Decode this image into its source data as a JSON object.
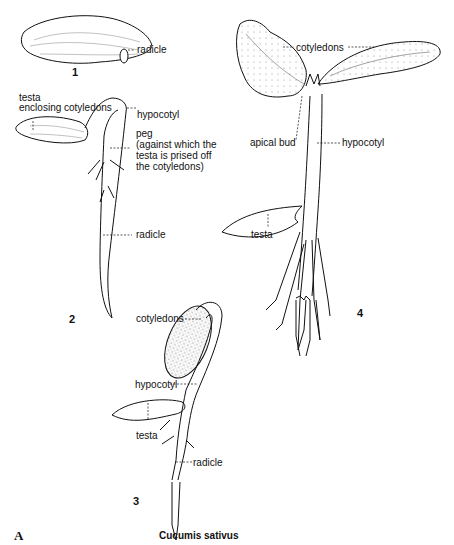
{
  "figure": {
    "letter": "A",
    "species": "Cucumis sativus"
  },
  "stages": [
    {
      "number": "1",
      "labels": {
        "radicle": "radicle"
      }
    },
    {
      "number": "2",
      "labels": {
        "testa": "testa",
        "testa_sub": "enclosing cotyledons",
        "hypocotyl": "hypocotyl",
        "peg": "peg",
        "peg_note_1": "(against which the",
        "peg_note_2": "testa is prised off",
        "peg_note_3": "the cotyledons)",
        "radicle": "radicle"
      }
    },
    {
      "number": "3",
      "labels": {
        "cotyledons": "cotyledons",
        "hypocotyl": "hypocotyl",
        "testa": "testa",
        "radicle": "radicle"
      }
    },
    {
      "number": "4",
      "labels": {
        "cotyledons": "cotyledons",
        "apical_bud": "apical bud",
        "hypocotyl": "hypocotyl",
        "testa": "testa"
      }
    }
  ],
  "colors": {
    "ink": "#111111",
    "background": "#ffffff",
    "stipple": "#555555"
  }
}
